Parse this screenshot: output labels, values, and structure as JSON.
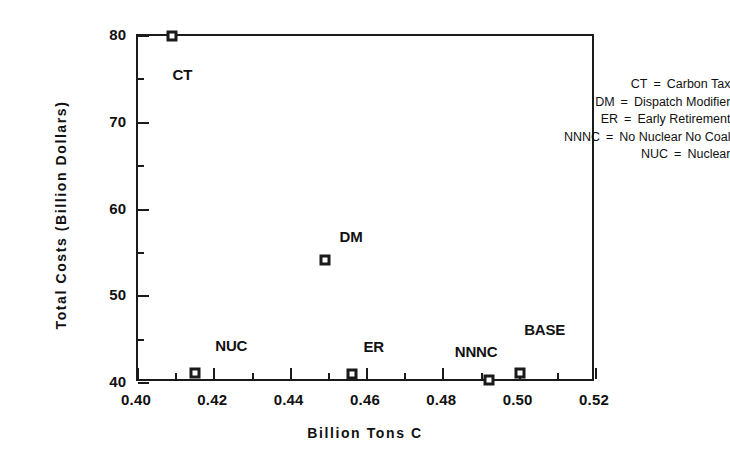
{
  "chart_data": {
    "type": "scatter",
    "title": "",
    "xlabel": "Billion Tons C",
    "ylabel": "Total Costs (Billion Dollars)",
    "xlim": [
      0.4,
      0.52
    ],
    "ylim": [
      40,
      80
    ],
    "grid": false,
    "legend_position": "upper-right",
    "x_major_ticks": [
      0.4,
      0.42,
      0.44,
      0.46,
      0.48,
      0.5,
      0.52
    ],
    "x_tick_labels": [
      "0.40",
      "0.42",
      "0.44",
      "0.46",
      "0.48",
      "0.50",
      "0.52"
    ],
    "x_minor_ticks": [
      0.41,
      0.43,
      0.45,
      0.47,
      0.49,
      0.51
    ],
    "y_major_ticks": [
      40,
      50,
      60,
      70,
      80
    ],
    "y_tick_labels": [
      "40",
      "50",
      "60",
      "70",
      "80"
    ],
    "y_minor_ticks": [
      45,
      55,
      65,
      75
    ],
    "points": [
      {
        "label": "CT",
        "x": 0.409,
        "y": 80.0,
        "label_dx": 10,
        "label_dy": 38
      },
      {
        "label": "DM",
        "x": 0.449,
        "y": 54.2,
        "label_dx": 26,
        "label_dy": -24
      },
      {
        "label": "NUC",
        "x": 0.415,
        "y": 41.2,
        "label_dx": 36,
        "label_dy": -28
      },
      {
        "label": "ER",
        "x": 0.456,
        "y": 41.0,
        "label_dx": 22,
        "label_dy": -28
      },
      {
        "label": "NNNC",
        "x": 0.492,
        "y": 40.3,
        "label_dx": -13,
        "label_dy": -29
      },
      {
        "label": "BASE",
        "x": 0.5,
        "y": 41.2,
        "label_dx": 25,
        "label_dy": -44
      }
    ],
    "annotations": []
  },
  "legend": {
    "entries": [
      {
        "key": "CT",
        "eq": "=",
        "value": "Carbon Tax"
      },
      {
        "key": "DM",
        "eq": "=",
        "value": "Dispatch Modifier"
      },
      {
        "key": "ER",
        "eq": "=",
        "value": "Early Retirement"
      },
      {
        "key": "NNNC",
        "eq": "=",
        "value": "No Nuclear No Coal"
      },
      {
        "key": "NUC",
        "eq": "=",
        "value": "Nuclear"
      }
    ]
  },
  "colors": {
    "foreground": "#1a1a1a",
    "background": "#ffffff",
    "marker_fill": "#1a1a1a",
    "marker_center": "#ffffff"
  }
}
